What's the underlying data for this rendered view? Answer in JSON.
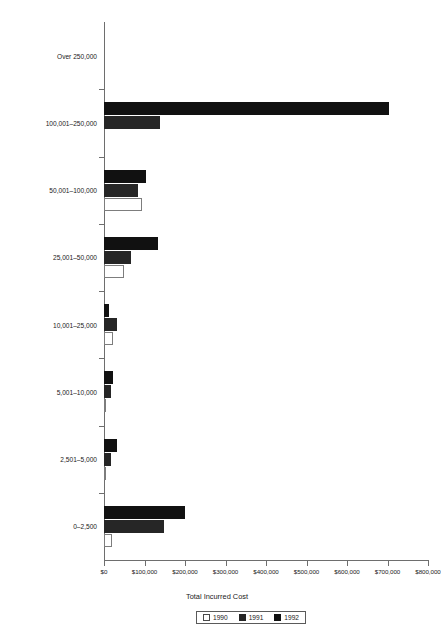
{
  "chart_data": {
    "type": "bar",
    "orientation": "horizontal",
    "title": "",
    "xlabel": "Total Incurred Cost",
    "ylabel": "Claim Range",
    "categories": [
      "Over 250,000",
      "100,001–250,000",
      "50,001–100,000",
      "25,001–50,000",
      "10,001–25,000",
      "5,001–10,000",
      "2,501–5,000",
      "0–2,500"
    ],
    "series": [
      {
        "name": "1990",
        "color": "#ffffff",
        "values": [
          0,
          0,
          93000,
          49000,
          21000,
          4000,
          4000,
          20000
        ]
      },
      {
        "name": "1991",
        "color": "#262626",
        "values": [
          0,
          139000,
          85000,
          67000,
          31000,
          17000,
          17000,
          148000
        ]
      },
      {
        "name": "1992",
        "color": "#111111",
        "values": [
          0,
          704000,
          104000,
          133000,
          13000,
          21000,
          33000,
          200000
        ]
      }
    ],
    "x_ticks": [
      0,
      100000,
      200000,
      300000,
      400000,
      500000,
      600000,
      700000,
      800000
    ],
    "x_tick_labels": [
      "$0",
      "$100,000",
      "$200,000",
      "$300,000",
      "$400,000",
      "$500,000",
      "$600,000",
      "$700,000",
      "$800,000"
    ],
    "xlim": [
      0,
      800000
    ],
    "grid": false,
    "legend_position": "bottom",
    "legend_entries": [
      "1990",
      "1991",
      "1992"
    ]
  },
  "axes": {
    "x_title": "Total Incurred Cost",
    "y_title": "Claim Range"
  },
  "legend": {
    "entries": [
      {
        "label": "1990",
        "swatch": "1990"
      },
      {
        "label": "1991",
        "swatch": "1991"
      },
      {
        "label": "1992",
        "swatch": "1992"
      }
    ]
  }
}
